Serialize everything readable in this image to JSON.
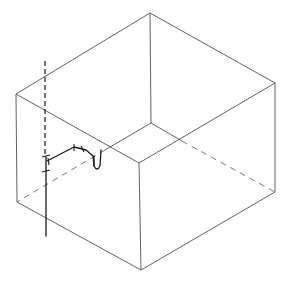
{
  "figure": {
    "type": "isometric-line-drawing",
    "colors": {
      "background": "#ffffff",
      "line": "#3a3a3a",
      "pipe": "#1a1a1a"
    },
    "box": {
      "vertices": {
        "top_back": [
          150,
          13
        ],
        "top_left": [
          16,
          94
        ],
        "top_right": [
          275,
          83
        ],
        "top_front": [
          139,
          163
        ],
        "bottom_left": [
          17,
          202
        ],
        "bottom_right": [
          275,
          192
        ],
        "bottom_front": [
          141,
          270
        ],
        "bottom_back_hidden": [
          151,
          123
        ]
      }
    },
    "pipe": {
      "riser_dashed": {
        "x": 45,
        "y_start": 61,
        "y_end": 157
      },
      "riser_solid": {
        "x": 46,
        "y_start": 157,
        "y_end": 236
      },
      "branch_points": [
        [
          47,
          161
        ],
        [
          74,
          147
        ],
        [
          86,
          150
        ],
        [
          93,
          156
        ],
        [
          94,
          167
        ],
        [
          97,
          170
        ],
        [
          100,
          167
        ],
        [
          101,
          150
        ]
      ]
    }
  }
}
